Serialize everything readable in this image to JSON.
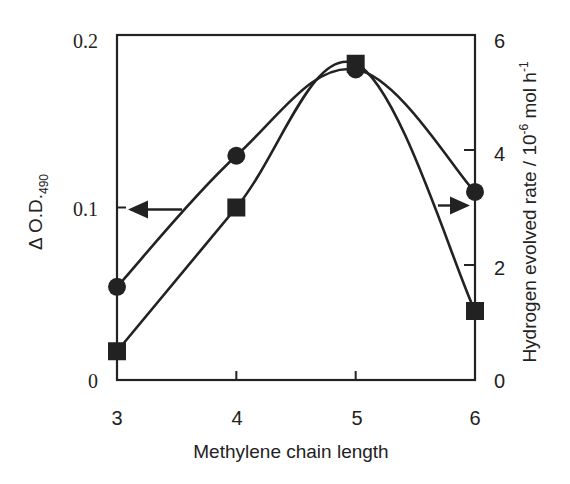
{
  "chart_data": {
    "type": "line",
    "title": "",
    "xlabel": "Methylene chain length",
    "ylabel_left": "Δ O.D.490",
    "ylabel_left_main": "Δ O.D.",
    "ylabel_left_sub": "490",
    "ylabel_right": "Hydrogen evolved rate / 10-6 mol h-1",
    "ylabel_right_parts": {
      "main": "Hydrogen evolved rate / 10",
      "exp1": "-6",
      "mid": " mol h",
      "exp2": "-1"
    },
    "x": [
      3,
      4,
      5,
      6
    ],
    "xticks": [
      "3",
      "4",
      "5",
      "6"
    ],
    "xlim": [
      3,
      6
    ],
    "ylim_left": [
      0,
      0.2
    ],
    "yticks_left": [
      "0",
      "0.1",
      "0.2"
    ],
    "ylim_right": [
      0,
      6
    ],
    "yticks_right": [
      "0",
      "2",
      "4",
      "6"
    ],
    "grid": false,
    "legend": "none (arrows indicate axes)",
    "series": [
      {
        "name": "Δ O.D.490",
        "marker": "circle",
        "axis": "left",
        "values": [
          0.054,
          0.13,
          0.18,
          0.109
        ]
      },
      {
        "name": "Hydrogen evolved rate",
        "marker": "square",
        "axis": "right",
        "values": [
          0.5,
          3.0,
          5.5,
          1.2
        ]
      }
    ],
    "annotations": [
      {
        "type": "arrow",
        "direction": "left",
        "points_to": "left axis",
        "at_y_left": 0.1
      },
      {
        "type": "arrow",
        "direction": "right",
        "points_to": "right axis",
        "at_y_right": 3.0
      }
    ]
  }
}
